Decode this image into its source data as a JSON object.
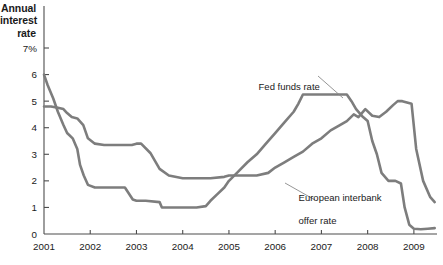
{
  "axis_title": {
    "line1": "Annual",
    "line2": "interest",
    "line3": "rate"
  },
  "annotations": {
    "fed": "Fed funds rate",
    "euro_line1": "European interbank",
    "euro_line2": "offer rate"
  },
  "colors": {
    "line": "#7d7d7d",
    "axis": "#4d4d4d",
    "text": "#1a1a1a"
  },
  "chart_data": {
    "type": "line",
    "title": "",
    "xlabel": "",
    "ylabel": "Annual interest rate",
    "xlim": [
      2001,
      2009.5
    ],
    "ylim": [
      0,
      7
    ],
    "grid": false,
    "legend": "annotations",
    "ytick_labels": [
      "0",
      "1",
      "2",
      "3",
      "4",
      "5",
      "6",
      "7%"
    ],
    "yticks": [
      0,
      1,
      2,
      3,
      4,
      5,
      6,
      7
    ],
    "xtick_labels": [
      "2001",
      "2002",
      "2003",
      "2004",
      "2005",
      "2006",
      "2007",
      "2008",
      "2009"
    ],
    "xticks": [
      2001,
      2002,
      2003,
      2004,
      2005,
      2006,
      2007,
      2008,
      2009
    ],
    "series": [
      {
        "name": "Fed funds rate",
        "x": [
          2001.0,
          2001.08,
          2001.2,
          2001.3,
          2001.42,
          2001.5,
          2001.62,
          2001.72,
          2001.78,
          2001.86,
          2001.95,
          2002.1,
          2002.4,
          2002.75,
          2002.92,
          2003.0,
          2003.2,
          2003.5,
          2003.55,
          2003.8,
          2004.0,
          2004.3,
          2004.5,
          2004.6,
          2004.75,
          2004.9,
          2005.0,
          2005.2,
          2005.4,
          2005.6,
          2005.8,
          2006.0,
          2006.2,
          2006.4,
          2006.5,
          2006.6,
          2007.0,
          2007.4,
          2007.55,
          2007.65,
          2007.75,
          2007.9,
          2008.0,
          2008.1,
          2008.2,
          2008.3,
          2008.45,
          2008.6,
          2008.72,
          2008.8,
          2008.9,
          2009.0,
          2009.15,
          2009.3,
          2009.45
        ],
        "y": [
          6.0,
          5.6,
          5.1,
          4.6,
          4.1,
          3.8,
          3.6,
          3.2,
          2.6,
          2.2,
          1.85,
          1.75,
          1.75,
          1.75,
          1.3,
          1.25,
          1.25,
          1.2,
          1.0,
          1.0,
          1.0,
          1.0,
          1.05,
          1.25,
          1.5,
          1.75,
          2.0,
          2.35,
          2.7,
          3.0,
          3.4,
          3.8,
          4.2,
          4.6,
          4.9,
          5.25,
          5.25,
          5.25,
          5.25,
          5.0,
          4.7,
          4.4,
          4.25,
          3.5,
          3.0,
          2.3,
          2.0,
          2.0,
          1.9,
          1.0,
          0.35,
          0.2,
          0.18,
          0.2,
          0.22
        ]
      },
      {
        "name": "European interbank offer rate",
        "x": [
          2001.0,
          2001.15,
          2001.3,
          2001.42,
          2001.5,
          2001.6,
          2001.72,
          2001.85,
          2001.95,
          2002.1,
          2002.3,
          2002.6,
          2002.9,
          2003.0,
          2003.1,
          2003.3,
          2003.5,
          2003.7,
          2004.0,
          2004.3,
          2004.6,
          2004.9,
          2005.0,
          2005.3,
          2005.6,
          2005.85,
          2006.0,
          2006.2,
          2006.4,
          2006.6,
          2006.8,
          2007.0,
          2007.2,
          2007.4,
          2007.55,
          2007.7,
          2007.8,
          2007.95,
          2008.1,
          2008.25,
          2008.4,
          2008.55,
          2008.65,
          2008.75,
          2008.85,
          2008.95,
          2009.05,
          2009.2,
          2009.35,
          2009.45
        ],
        "y": [
          4.8,
          4.8,
          4.75,
          4.7,
          4.55,
          4.4,
          4.35,
          4.1,
          3.6,
          3.4,
          3.35,
          3.35,
          3.35,
          3.4,
          3.4,
          3.05,
          2.45,
          2.2,
          2.1,
          2.1,
          2.1,
          2.15,
          2.2,
          2.2,
          2.2,
          2.3,
          2.5,
          2.7,
          2.9,
          3.1,
          3.4,
          3.6,
          3.9,
          4.1,
          4.25,
          4.5,
          4.4,
          4.7,
          4.45,
          4.4,
          4.6,
          4.85,
          5.0,
          5.0,
          4.95,
          4.9,
          3.2,
          2.0,
          1.4,
          1.2
        ]
      }
    ]
  }
}
